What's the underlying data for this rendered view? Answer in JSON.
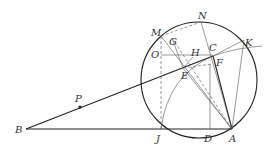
{
  "diagram": {
    "type": "geometry",
    "colors": {
      "stroke": "#222222",
      "thin": "#555555",
      "label": "#333333"
    },
    "circle": {
      "cx": 199,
      "cy": 80,
      "r": 58
    },
    "points": {
      "B": {
        "x": 26,
        "y": 129,
        "label": "B"
      },
      "P": {
        "x": 80,
        "y": 107,
        "label": "P"
      },
      "A": {
        "x": 232,
        "y": 129,
        "label": "A"
      },
      "J": {
        "x": 161,
        "y": 129,
        "label": "J"
      },
      "D": {
        "x": 210,
        "y": 129,
        "label": "D"
      },
      "N": {
        "x": 201,
        "y": 22,
        "label": "N"
      },
      "M": {
        "x": 161,
        "y": 36,
        "label": "M"
      },
      "K": {
        "x": 244,
        "y": 40,
        "label": "K"
      },
      "O": {
        "x": 161,
        "y": 55,
        "label": "O"
      },
      "C": {
        "x": 213,
        "y": 56,
        "label": "C"
      },
      "F": {
        "x": 212,
        "y": 64,
        "label": "F"
      },
      "H": {
        "x": 193,
        "y": 57,
        "label": "H"
      },
      "G": {
        "x": 172,
        "y": 38,
        "label": "G"
      },
      "E": {
        "x": 183,
        "y": 68,
        "label": "E"
      }
    },
    "labels": [
      "B",
      "P",
      "A",
      "J",
      "D",
      "N",
      "M",
      "K",
      "O",
      "C",
      "F",
      "H",
      "G",
      "E"
    ]
  }
}
